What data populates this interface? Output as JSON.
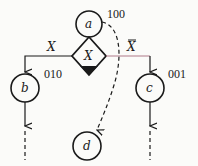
{
  "nodes": {
    "a": {
      "label": "a",
      "code": "100"
    },
    "b": {
      "label": "b",
      "code": "010"
    },
    "c": {
      "label": "c",
      "code": "001"
    },
    "d": {
      "label": "d"
    }
  },
  "decision": {
    "label": "X"
  },
  "branches": {
    "left": "X",
    "right": "X"
  },
  "colors": {
    "line": "#1a1a1a",
    "right_branch": "#b07a8a"
  }
}
